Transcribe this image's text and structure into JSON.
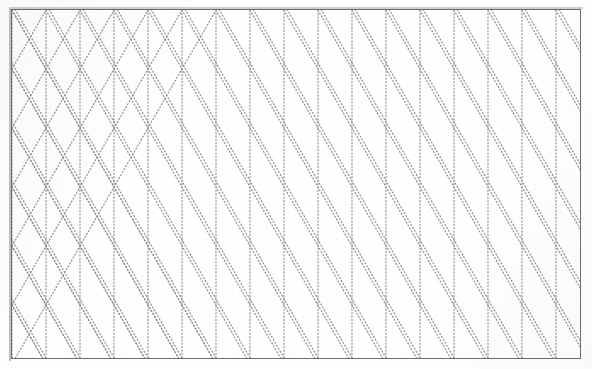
{
  "document": {
    "kind": "isometric-dot-grid-sheet",
    "title": "Isometric Dot Grid Sheet",
    "description": "Scanned sheet of isometric (triangular) dotted graph paper enclosed in a thin rectangular ruled border.",
    "visible_text": "",
    "page": {
      "width_px": 592,
      "height_px": 369,
      "background_color": "#fefefe"
    },
    "border": {
      "name": "rectangular-rule-frame",
      "color": "#6e6e6e",
      "thickness_px": 1,
      "left_px": 11,
      "top_px": 9,
      "width_px": 570,
      "height_px": 350
    },
    "grid": {
      "name": "isometric-triangular-dot-grid",
      "line_style": "dotted",
      "dot_color": "#8d8d8d",
      "dot_size_px": 1.15,
      "dot_spacing_px": 3.4,
      "vertical_line_pitch_px": 34,
      "vertical_repeat_px": 59,
      "diagonal_angle_deg": 60,
      "line_families": [
        "vertical",
        "diagonal-up-60",
        "diagonal-down-60"
      ],
      "vertical_line_count": 18,
      "horizontal_band_count": 6,
      "cell_shape": "equilateral-triangle",
      "composite_shape": "hexagon"
    }
  }
}
